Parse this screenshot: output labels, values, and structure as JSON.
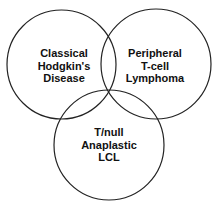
{
  "diagram": {
    "type": "venn",
    "stroke_color": "#222222",
    "background": "#ffffff",
    "sets": [
      {
        "id": "classical-hodgkins",
        "lines": [
          "Classical",
          "Hodgkin's",
          "Disease"
        ],
        "cx": 61.5,
        "cy": 64.5,
        "r": 54.5
      },
      {
        "id": "peripheral-tcell",
        "lines": [
          "Peripheral",
          "T-cell",
          "Lymphoma"
        ],
        "cx": 156,
        "cy": 64,
        "r": 55
      },
      {
        "id": "tnull-anaplastic",
        "lines": [
          "T/null",
          "Anaplastic",
          "LCL"
        ],
        "cx": 109,
        "cy": 145,
        "r": 55
      }
    ]
  }
}
